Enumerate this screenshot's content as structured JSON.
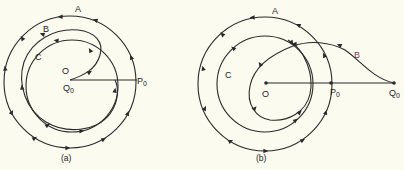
{
  "figure": {
    "panels": [
      {
        "id": "a",
        "caption": "(a)",
        "labels": {
          "A": "A",
          "B": "B",
          "C": "C",
          "O": "O",
          "Q0": "Q",
          "Q0_sub": "0",
          "P0": "P",
          "P0_sub": "0"
        },
        "description": "Curves A, B, C spiral around common center O = Q0; radial segment O–P0"
      },
      {
        "id": "b",
        "caption": "(b)",
        "labels": {
          "A": "A",
          "B": "B",
          "C": "C",
          "O": "O",
          "P0": "P",
          "P0_sub": "0",
          "Q0": "Q",
          "Q0_sub": "0"
        },
        "description": "Curves A and C about center O; curve B starts at Q0 outside and spirals inward; points O, P0, Q0 collinear"
      }
    ],
    "colors": {
      "ink": "#2a2a2a",
      "background": "#fbfbf0",
      "label_b_panel_b": "#7a3a55"
    }
  }
}
